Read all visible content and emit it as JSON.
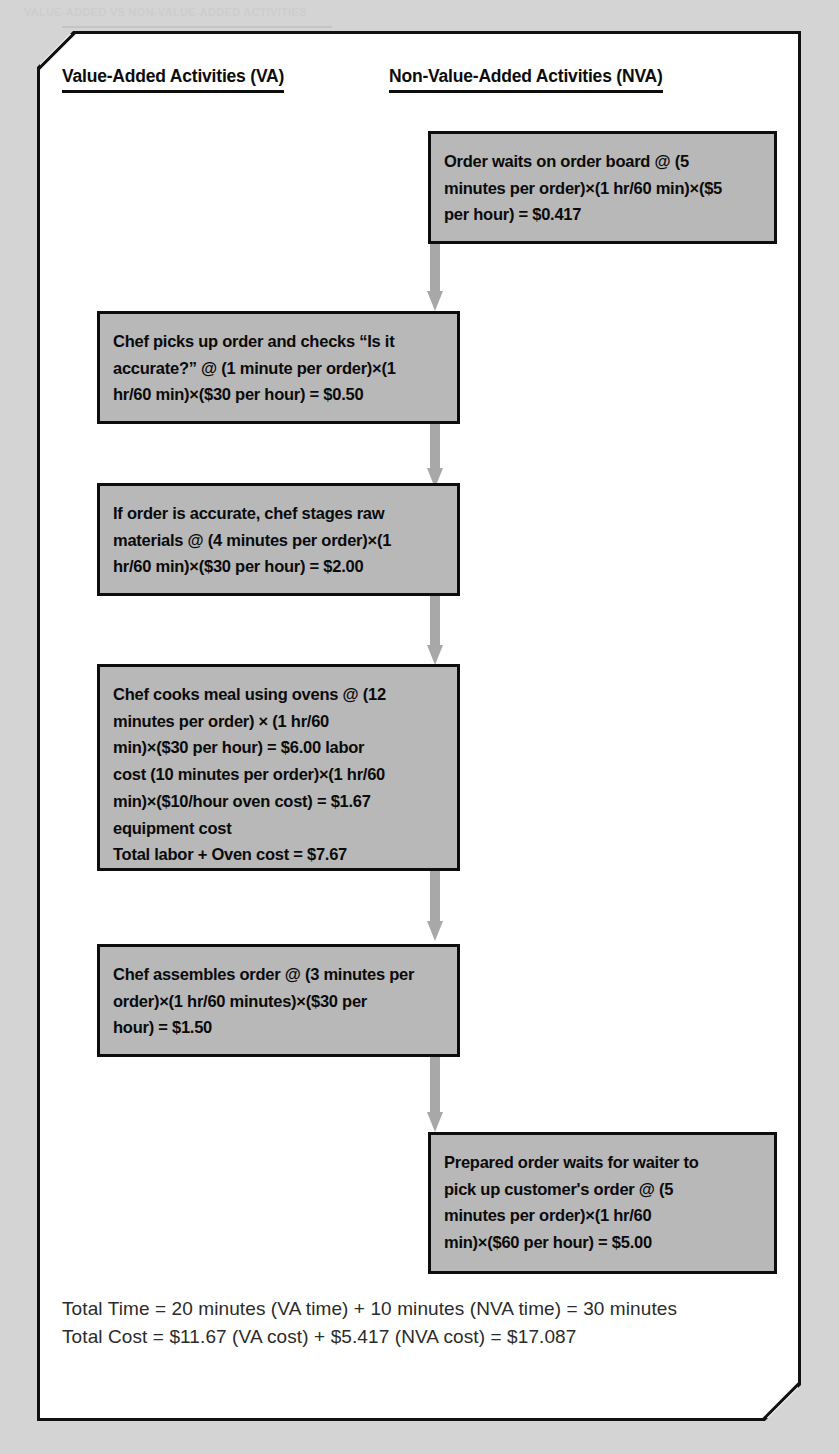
{
  "page": {
    "faint_header": "VALUE-ADDED VS NON-VALUE-ADDED ACTIVITIES",
    "background_color": "#d4d4d4",
    "frame_fill": "#ffffff",
    "box_fill": "#b8b8b8",
    "box_stroke": "#0d0d0d",
    "arrow_color": "#a8a8a8"
  },
  "headers": {
    "va": "Value-Added Activities (VA)",
    "nva": "Non-Value-Added Activities (NVA)"
  },
  "boxes": [
    {
      "id": "nva-order-waits",
      "column": "NVA",
      "lines": [
        "Order waits on order board @ (5",
        "minutes per order)×(1 hr/60 min)×($5",
        "per hour) = $0.417"
      ]
    },
    {
      "id": "va-chef-picks-up",
      "column": "VA",
      "lines": [
        "Chef picks up order and checks “Is it",
        "accurate?” @ (1 minute per order)×(1",
        "hr/60 min)×($30 per hour) = $0.50"
      ]
    },
    {
      "id": "va-stages-raw-materials",
      "column": "VA",
      "lines": [
        "If order is accurate, chef stages raw",
        "materials @ (4 minutes per order)×(1",
        "hr/60 min)×($30 per hour) = $2.00"
      ]
    },
    {
      "id": "va-cooks-meal",
      "column": "VA",
      "lines": [
        "Chef cooks meal using ovens @ (12",
        "minutes per order) × (1 hr/60",
        "min)×($30 per hour) = $6.00 labor",
        "cost (10 minutes per order)×(1 hr/60",
        "min)×($10/hour oven cost) = $1.67",
        "equipment cost",
        "Total labor + Oven cost = $7.67"
      ]
    },
    {
      "id": "va-assembles-order",
      "column": "VA",
      "lines": [
        "Chef assembles order @ (3 minutes per",
        "order)×(1 hr/60 minutes)×($30 per",
        "hour) = $1.50"
      ]
    },
    {
      "id": "nva-prepared-order-waits",
      "column": "NVA",
      "lines": [
        "Prepared order waits for waiter to",
        "pick up customer's order @ (5",
        "minutes per order)×(1 hr/60",
        "min)×($60 per hour) = $5.00"
      ]
    }
  ],
  "totals": {
    "time": "Total Time = 20 minutes (VA time) + 10 minutes (NVA time) = 30 minutes",
    "cost": "Total Cost = $11.67 (VA cost) + $5.417 (NVA cost) = $17.087"
  }
}
